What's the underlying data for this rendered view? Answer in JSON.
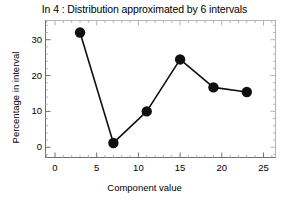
{
  "chart_data": {
    "type": "line",
    "title": "In 4 : Distribution approximated by 6 intervals",
    "xlabel": "Component value",
    "ylabel": "Percentage in interval",
    "x": [
      3,
      7,
      11,
      15,
      19,
      23
    ],
    "values": [
      32.0,
      1.2,
      10.0,
      24.5,
      16.7,
      15.4
    ],
    "series": [
      {
        "name": "Percentage in interval",
        "x": [
          3,
          7,
          11,
          15,
          19,
          23
        ],
        "values": [
          32.0,
          1.2,
          10.0,
          24.5,
          16.7,
          15.4
        ]
      }
    ],
    "xlim": [
      -1.2,
      26.5
    ],
    "ylim": [
      -3.0,
      35.5
    ],
    "xticks": [
      0,
      5,
      10,
      15,
      20,
      25
    ],
    "xtick_labels": [
      "0",
      "5",
      "10",
      "15",
      "20",
      "25"
    ],
    "yticks": [
      0,
      10,
      20,
      30
    ],
    "ytick_labels": [
      "0",
      "10",
      "20",
      "30"
    ],
    "x_minor_step": 1,
    "y_minor_step": 2,
    "grid": false,
    "legend": false,
    "legend_position": "none",
    "marker": "filled-circle",
    "marker_size": 5.2,
    "line_width": 1.6,
    "line_color": "#101010",
    "marker_color": "#101010",
    "frame_color": "#b4b4b4",
    "axis_color": "#6e6e6e",
    "background": "#ffffff"
  }
}
